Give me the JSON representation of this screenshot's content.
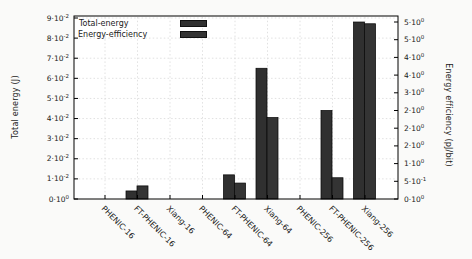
{
  "chart_data": {
    "type": "bar",
    "categories": [
      "PHENIC-16",
      "FT-PHENIC-16",
      "Xiang-16",
      "PHENIC-64",
      "FT-PHENIC-64",
      "Xiang-64",
      "PHENIC-256",
      "FT-PHENIC-256",
      "Xiang-256"
    ],
    "series": [
      {
        "name": "Total-energy",
        "axis": "left",
        "unit": "J",
        "color": "#303030",
        "values": [
          0,
          0.004,
          0,
          0,
          0.012,
          0.065,
          0,
          0.044,
          0.088
        ]
      },
      {
        "name": "Energy-efficiency",
        "axis": "right",
        "unit": "pJ/bit",
        "color": "#343434",
        "values": [
          0,
          0.37,
          0,
          0,
          0.45,
          2.3,
          0,
          0.6,
          4.95
        ]
      }
    ],
    "left_axis": {
      "label": "Total energy (J)",
      "min": 0,
      "max": 0.09,
      "tick_step": 0.01,
      "tick_values": [
        0,
        0.01,
        0.02,
        0.03,
        0.04,
        0.05,
        0.06,
        0.07,
        0.08,
        0.09
      ],
      "tick_labels": [
        "0·10^0",
        "1·10^-2",
        "2·10^-2",
        "3·10^-2",
        "4·10^-2",
        "5·10^-2",
        "6·10^-2",
        "7·10^-2",
        "8·10^-2",
        "9·10^-2"
      ]
    },
    "right_axis": {
      "label": "Energy efficiency (pJ/bit)",
      "min": 0,
      "max": 5,
      "tick_step": 0.5,
      "tick_values": [
        0,
        0.5,
        1,
        1.5,
        2,
        2.5,
        3,
        3.5,
        4,
        4.5,
        5
      ],
      "tick_labels": [
        "0·10^0",
        "5·10^-1",
        "1·10^0",
        "2·10^0",
        "2·10^0",
        "2·10^0",
        "3·10^0",
        "4·10^0",
        "4·10^0",
        "5·10^0",
        "5·10^0"
      ]
    },
    "legend": {
      "position": "top-left",
      "entries": [
        "Total-energy",
        "Energy-efficiency"
      ]
    },
    "grid": true
  },
  "colors": {
    "grid": "#d9d9d9",
    "axis": "#000000",
    "text": "#1a1a1a",
    "plot_background": "#ffffff",
    "swatch_total_energy": "#303030",
    "swatch_energy_efficiency": "#343434"
  }
}
